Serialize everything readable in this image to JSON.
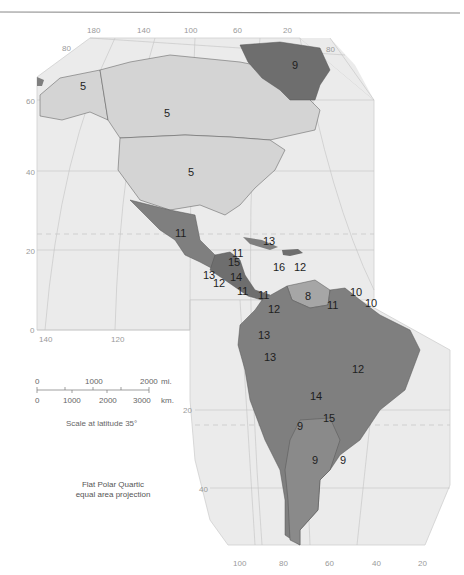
{
  "map": {
    "title": "",
    "colors": {
      "ocean_panel": "#ebebeb",
      "grid": "#bdbdbd",
      "level_light": "#d4d4d4",
      "level_medium": "#a6a6a6",
      "level_dark": "#7f7f7f",
      "level_darker": "#6e6e6e",
      "border": "#555555",
      "top_rule": "#888888"
    },
    "top_longitudes": [
      "180",
      "140",
      "100",
      "60",
      "20"
    ],
    "top_latitude_80_left": "80",
    "top_latitude_80_right": "80",
    "left_latitudes": [
      "60",
      "40",
      "20",
      "0"
    ],
    "mid_longitudes": [
      "140",
      "120"
    ],
    "lower_latitudes": [
      "20",
      "40"
    ],
    "bottom_longitudes": [
      "100",
      "80",
      "60",
      "40",
      "20"
    ],
    "regions": [
      {
        "label": "5",
        "name": "Alaska"
      },
      {
        "label": "5",
        "name": "Canada"
      },
      {
        "label": "5",
        "name": "United States"
      },
      {
        "label": "9",
        "name": "Greenland"
      },
      {
        "label": "11",
        "name": "Mexico"
      },
      {
        "label": "13",
        "name": "Cuba"
      },
      {
        "label": "11",
        "name": "Belize"
      },
      {
        "label": "15",
        "name": "Honduras"
      },
      {
        "label": "13",
        "name": "Guatemala"
      },
      {
        "label": "12",
        "name": "El Salvador"
      },
      {
        "label": "14",
        "name": "Nicaragua"
      },
      {
        "label": "11",
        "name": "Costa Rica"
      },
      {
        "label": "11",
        "name": "Panama"
      },
      {
        "label": "16",
        "name": "Haiti"
      },
      {
        "label": "12",
        "name": "Dominican Republic"
      },
      {
        "label": "8",
        "name": "Venezuela"
      },
      {
        "label": "12",
        "name": "Colombia"
      },
      {
        "label": "11",
        "name": "Guyana"
      },
      {
        "label": "10",
        "name": "Suriname"
      },
      {
        "label": "10",
        "name": "French Guiana"
      },
      {
        "label": "13",
        "name": "Ecuador"
      },
      {
        "label": "13",
        "name": "Peru"
      },
      {
        "label": "12",
        "name": "Brazil"
      },
      {
        "label": "14",
        "name": "Bolivia"
      },
      {
        "label": "15",
        "name": "Paraguay"
      },
      {
        "label": "9",
        "name": "Chile"
      },
      {
        "label": "9",
        "name": "Argentina"
      },
      {
        "label": "9",
        "name": "Uruguay"
      }
    ]
  },
  "scale": {
    "miles_labels": [
      "0",
      "1000",
      "2000"
    ],
    "miles_unit": "mi.",
    "km_labels": [
      "0",
      "1000",
      "2000",
      "3000"
    ],
    "km_unit": "km.",
    "caption": "Scale at latitude 35°"
  },
  "projection": {
    "line1": "Flat Polar Quartic",
    "line2": "equal area projection"
  }
}
